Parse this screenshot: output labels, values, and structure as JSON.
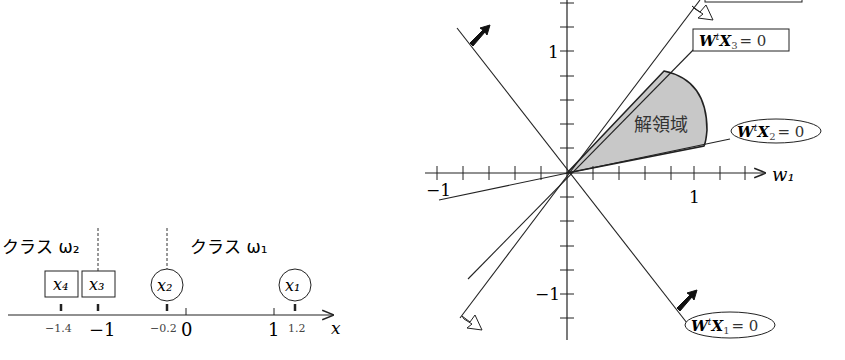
{
  "left_figure": {
    "axis_label": "x",
    "class_labels": {
      "class2": "クラス ω₂",
      "class1": "クラス ω₁"
    },
    "points": [
      {
        "name": "x₄",
        "value": -1.4,
        "shape": "square",
        "class": "ω₂"
      },
      {
        "name": "x₃",
        "value": -1.0,
        "shape": "square",
        "class": "ω₂"
      },
      {
        "name": "x₂",
        "value": -0.2,
        "shape": "circle",
        "class": "ω₁"
      },
      {
        "name": "x₁",
        "value": 1.2,
        "shape": "circle",
        "class": "ω₁"
      }
    ],
    "tick_labels": {
      "t_m14": "−1.4",
      "t_m1": "−1",
      "t_m02": "−0.2",
      "t_0": "0",
      "t_1": "1",
      "t_12": "1.2"
    },
    "boundaries": [
      -1.0,
      -0.2
    ]
  },
  "right_figure": {
    "x_axis_label": "w₁",
    "x_tick_labels": {
      "neg": "−1",
      "pos": "1"
    },
    "y_tick_labels": {
      "pos": "1",
      "neg": "−1"
    },
    "region_label": "解領域",
    "equations": {
      "eq1": "WᵗX₁ = 0",
      "eq2": "WᵗX₂ = 0",
      "eq3": "WᵗX₃ = 0"
    },
    "eq_parts": {
      "W": "W",
      "t": "t",
      "X": "X",
      "s1": "1",
      "s2": "2",
      "s3": "3",
      "rhs": "= 0"
    }
  },
  "colors": {
    "line": "#222222",
    "region_fill": "#c8c8c8",
    "background": "#ffffff"
  }
}
